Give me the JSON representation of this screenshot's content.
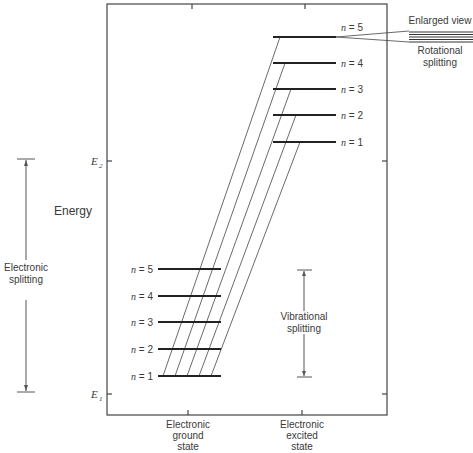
{
  "diagram": {
    "axis_label": "Energy",
    "energy_markers": [
      {
        "symbol": "E",
        "subscript": "2",
        "y": 161
      },
      {
        "symbol": "E",
        "subscript": "1",
        "y": 394
      }
    ],
    "electronic_splitting": {
      "line1": "Electronic",
      "line2": "splitting"
    },
    "vibrational_splitting": {
      "line1": "Vibrational",
      "line2": "splitting"
    },
    "enlarged_view": {
      "title": "Enlarged view",
      "line1": "Rotational",
      "line2": "splitting"
    },
    "ground_state": {
      "label_lines": [
        "Electronic",
        "ground",
        "state"
      ],
      "levels": [
        {
          "n": "5",
          "label": "n = 5",
          "y": 269
        },
        {
          "n": "4",
          "label": "n = 4",
          "y": 296
        },
        {
          "n": "3",
          "label": "n = 3",
          "y": 322
        },
        {
          "n": "2",
          "label": "n = 2",
          "y": 349
        },
        {
          "n": "1",
          "label": "n = 1",
          "y": 376
        }
      ]
    },
    "excited_state": {
      "label_lines": [
        "Electronic",
        "excited",
        "state"
      ],
      "levels": [
        {
          "n": "5",
          "label": "n = 5",
          "y": 37
        },
        {
          "n": "4",
          "label": "n = 4",
          "y": 63
        },
        {
          "n": "3",
          "label": "n = 3",
          "y": 89
        },
        {
          "n": "2",
          "label": "n = 2",
          "y": 115
        },
        {
          "n": "1",
          "label": "n = 1",
          "y": 142
        }
      ]
    },
    "transitions": [
      {
        "from": "ground n=1",
        "to": "excited n=5"
      },
      {
        "from": "ground n=1",
        "to": "excited n=4"
      },
      {
        "from": "ground n=1",
        "to": "excited n=3"
      },
      {
        "from": "ground n=1",
        "to": "excited n=2"
      },
      {
        "from": "ground n=1",
        "to": "excited n=1"
      }
    ]
  }
}
